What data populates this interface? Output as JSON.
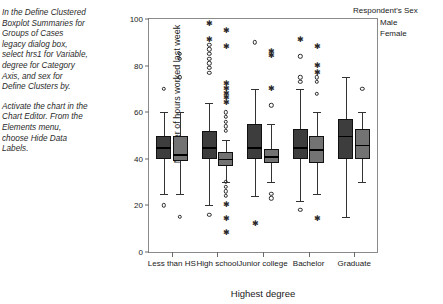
{
  "instructions": [
    "In the Define Clustered Boxplot Summaries for Groups of Cases legacy dialog box, select hrs1 for Variable, degree for Category Axis, and sex for Define Clusters by.",
    "Activate the chart in the Chart Editor. From the Elements menu, choose Hide Data Labels."
  ],
  "legend": {
    "title": "Respondent's Sex",
    "items": [
      {
        "label": "Male",
        "color": "#3d3d3d"
      },
      {
        "label": "Female",
        "color": "#737373"
      }
    ]
  },
  "chart_data": {
    "type": "boxplot",
    "title": "",
    "xlabel": "Highest degree",
    "ylabel": "Number of hours worked last week",
    "ylim": [
      0,
      100
    ],
    "yticks": [
      0,
      20,
      40,
      60,
      80,
      100
    ],
    "grid": false,
    "legend_position": "top-right",
    "categories": [
      "Less than HS",
      "High school",
      "Junior college",
      "Bachelor",
      "Graduate"
    ],
    "series": [
      {
        "name": "Male",
        "color": "#3d3d3d",
        "boxes": [
          {
            "category": "Less than HS",
            "whisker_low": 25,
            "q1": 40,
            "median": 45,
            "q3": 50,
            "whisker_high": 60,
            "outliers_circle": [
              70,
              20
            ],
            "outliers_star": []
          },
          {
            "category": "High school",
            "whisker_low": 20,
            "q1": 40,
            "median": 45,
            "q3": 52,
            "whisker_high": 64,
            "outliers_circle": [
              89,
              87,
              85,
              83,
              81,
              79,
              77,
              16
            ],
            "outliers_star": [
              98,
              91
            ]
          },
          {
            "category": "Junior college",
            "whisker_low": 24,
            "q1": 40,
            "median": 45,
            "q3": 55,
            "whisker_high": 70,
            "outliers_circle": [
              90
            ],
            "outliers_star": [
              12
            ]
          },
          {
            "category": "Bachelor",
            "whisker_low": 22,
            "q1": 40,
            "median": 45,
            "q3": 53,
            "whisker_high": 70,
            "outliers_circle": [
              84,
              75,
              73,
              18
            ],
            "outliers_star": [
              91
            ]
          },
          {
            "category": "Graduate",
            "whisker_low": 15,
            "q1": 40,
            "median": 50,
            "q3": 57,
            "whisker_high": 75,
            "outliers_circle": [],
            "outliers_star": []
          }
        ]
      },
      {
        "name": "Female",
        "color": "#737373",
        "boxes": [
          {
            "category": "Less than HS",
            "whisker_low": 25,
            "q1": 39,
            "median": 42,
            "q3": 50,
            "whisker_high": 60,
            "outliers_circle": [
              85,
              83,
              75,
              15
            ],
            "outliers_star": []
          },
          {
            "category": "High school",
            "whisker_low": 30,
            "q1": 37,
            "median": 40,
            "q3": 43,
            "whisker_high": 48,
            "outliers_circle": [
              60,
              58,
              56,
              54,
              52,
              30,
              28,
              26,
              24
            ],
            "outliers_star": [
              95,
              88,
              72,
              70,
              68,
              66,
              64,
              20,
              14,
              8
            ]
          },
          {
            "category": "Junior college",
            "whisker_low": 30,
            "q1": 38,
            "median": 41,
            "q3": 44,
            "whisker_high": 55,
            "outliers_circle": [
              63,
              25,
              23
            ],
            "outliers_star": [
              86,
              84,
              70
            ]
          },
          {
            "category": "Bachelor",
            "whisker_low": 25,
            "q1": 38,
            "median": 44,
            "q3": 50,
            "whisker_high": 60,
            "outliers_circle": [
              75,
              73,
              68
            ],
            "outliers_star": [
              88,
              80,
              77,
              14
            ]
          },
          {
            "category": "Graduate",
            "whisker_low": 30,
            "q1": 40,
            "median": 46,
            "q3": 53,
            "whisker_high": 60,
            "outliers_circle": [
              70
            ],
            "outliers_star": []
          }
        ]
      }
    ]
  }
}
